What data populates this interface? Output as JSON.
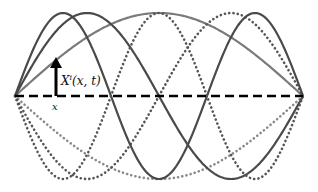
{
  "diagram": {
    "endpoints": {
      "left": [
        15,
        96
      ],
      "right": [
        303,
        96
      ]
    },
    "amplitude": 83,
    "modes": [
      {
        "n": 1,
        "style": "solid",
        "color": "#7a7a7a",
        "sign": 1
      },
      {
        "n": 1,
        "style": "dotted",
        "color": "#8a8a8a",
        "sign": -1
      },
      {
        "n": 2,
        "style": "solid",
        "color": "#4a4a4a",
        "sign": 1
      },
      {
        "n": 2,
        "style": "dotted",
        "color": "#555555",
        "sign": -1
      },
      {
        "n": 3,
        "style": "solid",
        "color": "#4a4a4a",
        "sign": 1
      },
      {
        "n": 3,
        "style": "dotted",
        "color": "#555555",
        "sign": -1
      }
    ],
    "equilibrium_line": {
      "style": "dashed",
      "color": "#000000"
    },
    "displacement_arrow": {
      "x": 56,
      "from_y": 96,
      "to_y": 58,
      "color": "#000000"
    },
    "labels": {
      "displacement": "X",
      "displacement_sup": "i",
      "displacement_args": "(x, t)",
      "position": "x"
    }
  }
}
